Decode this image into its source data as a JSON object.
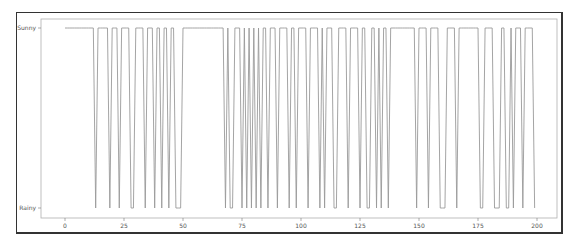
{
  "chart_data": {
    "type": "line",
    "title": "",
    "xlabel": "",
    "ylabel": "",
    "xlim": [
      -10,
      208
    ],
    "xticks": [
      0,
      25,
      50,
      75,
      100,
      125,
      150,
      175,
      200
    ],
    "xtick_labels": [
      "0",
      "25",
      "50",
      "75",
      "100",
      "125",
      "150",
      "175",
      "200"
    ],
    "yticks": [
      "Rainy",
      "Sunny"
    ],
    "grid": false,
    "legend": null,
    "line_color": "#9a9a9a",
    "series": [
      {
        "name": "weather",
        "encoding": "1 = Sunny, 0 = Rainy",
        "x_start": 0,
        "values": [
          1,
          1,
          1,
          1,
          1,
          1,
          1,
          1,
          1,
          1,
          1,
          1,
          1,
          0,
          1,
          1,
          1,
          1,
          1,
          0,
          1,
          1,
          1,
          0,
          1,
          1,
          1,
          1,
          0,
          0,
          1,
          1,
          1,
          1,
          0,
          1,
          1,
          1,
          0,
          1,
          1,
          0,
          1,
          1,
          0,
          1,
          1,
          0,
          0,
          0,
          1,
          1,
          1,
          1,
          1,
          1,
          1,
          1,
          1,
          1,
          1,
          1,
          1,
          1,
          1,
          1,
          1,
          1,
          0,
          1,
          0,
          0,
          1,
          1,
          1,
          0,
          1,
          0,
          1,
          0,
          1,
          0,
          1,
          0,
          1,
          1,
          0,
          1,
          1,
          1,
          0,
          1,
          1,
          1,
          1,
          0,
          1,
          1,
          0,
          1,
          1,
          1,
          1,
          0,
          1,
          1,
          1,
          1,
          0,
          1,
          0,
          1,
          1,
          1,
          0,
          0,
          1,
          1,
          1,
          1,
          0,
          1,
          1,
          1,
          1,
          0,
          1,
          1,
          0,
          0,
          1,
          1,
          0,
          1,
          0,
          1,
          1,
          0,
          1,
          1,
          1,
          1,
          1,
          1,
          1,
          1,
          1,
          1,
          1,
          0,
          1,
          1,
          1,
          1,
          0,
          1,
          1,
          1,
          1,
          0,
          0,
          0,
          1,
          1,
          1,
          1,
          0,
          1,
          1,
          1,
          1,
          1,
          1,
          1,
          1,
          1,
          0,
          0,
          1,
          1,
          1,
          1,
          0,
          0,
          0,
          1,
          1,
          0,
          0,
          1,
          0,
          1,
          1,
          1,
          0,
          1,
          1,
          1,
          1,
          0
        ]
      }
    ]
  },
  "axes": {
    "y_labels": {
      "top": "Sunny",
      "bottom": "Rainy"
    },
    "x_labels": [
      "0",
      "25",
      "50",
      "75",
      "100",
      "125",
      "150",
      "175",
      "200"
    ]
  }
}
